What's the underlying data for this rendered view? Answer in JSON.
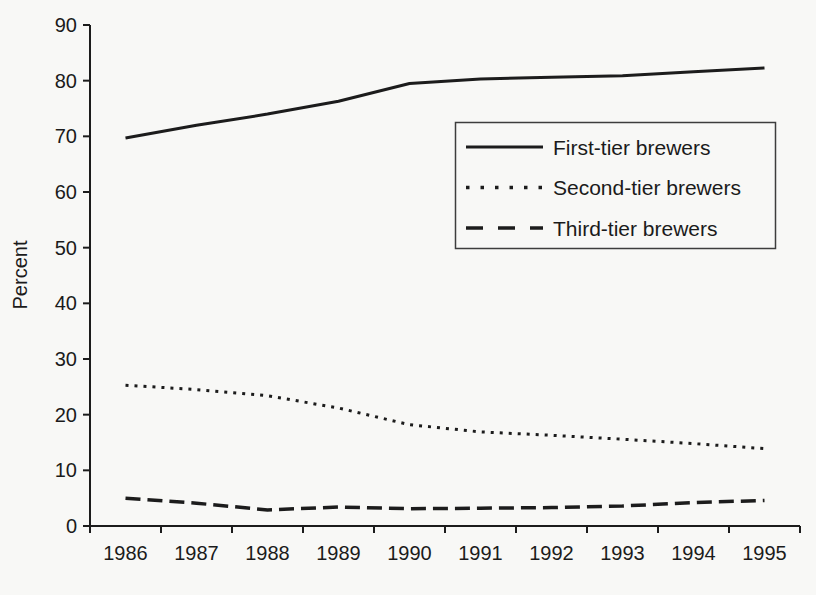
{
  "chart_data": {
    "type": "line",
    "title": "",
    "xlabel": "",
    "ylabel": "Percent",
    "ylim": [
      0,
      90
    ],
    "yticks": [
      0,
      10,
      20,
      30,
      40,
      50,
      60,
      70,
      80,
      90
    ],
    "grid": false,
    "legend_position": "inside-upper-right",
    "x": [
      "1986",
      "1987",
      "1988",
      "1989",
      "1990",
      "1991",
      "1992",
      "1993",
      "1994",
      "1995"
    ],
    "series": [
      {
        "name": "First-tier brewers",
        "line_style": "solid",
        "values": [
          69.7,
          72.0,
          74.0,
          76.3,
          79.5,
          80.3,
          80.6,
          80.9,
          81.6,
          82.3
        ]
      },
      {
        "name": "Second-tier brewers",
        "line_style": "dotted",
        "values": [
          25.3,
          24.5,
          23.4,
          21.2,
          18.2,
          16.9,
          16.3,
          15.6,
          14.8,
          13.9
        ]
      },
      {
        "name": "Third-tier brewers",
        "line_style": "dashed",
        "values": [
          5.0,
          4.1,
          2.9,
          3.4,
          3.1,
          3.2,
          3.3,
          3.6,
          4.2,
          4.6
        ]
      }
    ]
  },
  "colors": {
    "line": "#1c1c1c",
    "text": "#1b1b1b",
    "background": "#f8f8f6",
    "legend_border": "#3d3d3d"
  }
}
